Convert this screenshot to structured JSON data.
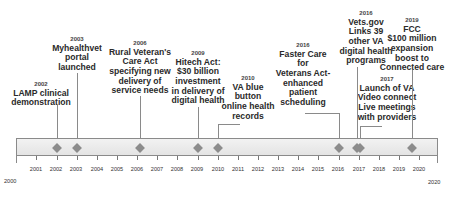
{
  "axis": {
    "start_label": "2000",
    "end_label": "2020",
    "ticks": [
      "2001",
      "2002",
      "2003",
      "2004",
      "2005",
      "2006",
      "2007",
      "2008",
      "2009",
      "2010",
      "2011",
      "2012",
      "2013",
      "2014",
      "2015",
      "2016",
      "2017",
      "2018",
      "2019",
      "2020"
    ]
  },
  "events": [
    {
      "year": "2002",
      "text": "LAMP clinical\ndemonstration"
    },
    {
      "year": "2003",
      "text": "Myhealthvet\nportal\nlaunched"
    },
    {
      "year": "2006",
      "text": "Rural Veteran's\nCare Act\nspecifying new\ndelivery of\nservice needs"
    },
    {
      "year": "2009",
      "text": "Hitech Act:\n$30 billion\ninvestment\nin delivery of\ndigital health"
    },
    {
      "year": "2010",
      "text": "VA blue\nbutton\nonline health\nrecords"
    },
    {
      "year": "2016",
      "text": "Faster Care\nfor\nVeterans Act-\nenhanced\npatient\nscheduling"
    },
    {
      "year": "2016",
      "text": "Vets.gov\nLinks 39\nother VA\ndigital health\nprograms"
    },
    {
      "year": "2017",
      "text": "Launch of VA\nVideo connect\nLive meetings\nwith providers"
    },
    {
      "year": "2019",
      "text": "FCC\n$100 million\nexpansion\nboost to\nConnected care"
    }
  ],
  "colors": {
    "marker": "#8c8c8c",
    "band": "#e8e8e8",
    "line": "#8a8a8a"
  }
}
